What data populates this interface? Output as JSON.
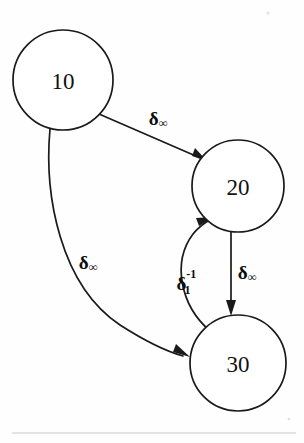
{
  "diagram": {
    "type": "state-transition-graph",
    "background_color": "#fefefe",
    "stroke_color": "#1a1a1a",
    "nodes": [
      {
        "id": "10",
        "label": "10",
        "cx": 63,
        "cy": 80,
        "r": 50
      },
      {
        "id": "20",
        "label": "20",
        "cx": 238,
        "cy": 186,
        "r": 46
      },
      {
        "id": "30",
        "label": "30",
        "cx": 238,
        "cy": 363,
        "r": 48
      }
    ],
    "edges": [
      {
        "id": "e-10-20",
        "from": "10",
        "to": "20",
        "shape": "straight",
        "label": {
          "base": "δ",
          "sub": "∞",
          "sup": "",
          "text": "δ∞"
        },
        "label_x": 158,
        "label_y": 118
      },
      {
        "id": "e-10-30",
        "from": "10",
        "to": "30",
        "shape": "curved",
        "label": {
          "base": "δ",
          "sub": "∞",
          "sup": "",
          "text": "δ∞"
        },
        "label_x": 88,
        "label_y": 262
      },
      {
        "id": "e-30-20",
        "from": "30",
        "to": "20",
        "shape": "curved-back",
        "label": {
          "base": "δ",
          "sub": "1",
          "sup": "-1",
          "text": "δ₁⁻¹"
        },
        "label_x": 186,
        "label_y": 283
      },
      {
        "id": "e-20-30",
        "from": "20",
        "to": "30",
        "shape": "straight-vertical",
        "label": {
          "base": "δ",
          "sub": "∞",
          "sup": "",
          "text": "δ∞"
        },
        "label_x": 247,
        "label_y": 272
      }
    ],
    "page_rule": {
      "y": 433,
      "x1": 12,
      "x2": 296
    }
  }
}
